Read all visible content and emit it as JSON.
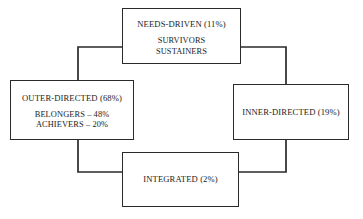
{
  "diagram": {
    "line_color": "#2a2a2a",
    "background_color": "#ffffff",
    "nodes": [
      {
        "id": "needs-driven",
        "title": "NEEDS-DRIVEN (11%)",
        "sub": [
          "SURVIVORS",
          "SUSTAINERS"
        ]
      },
      {
        "id": "outer-directed",
        "title": "OUTER-DIRECTED (68%)",
        "sub": [
          "BELONGERS – 48%",
          "ACHIEVERS – 20%"
        ]
      },
      {
        "id": "inner-directed",
        "title": "INNER-DIRECTED (19%)",
        "sub": []
      },
      {
        "id": "integrated",
        "title": "INTEGRATED (2%)",
        "sub": []
      }
    ],
    "connectors": [
      {
        "id": "needs-to-outer",
        "from": "needs-driven",
        "to": "outer-directed",
        "path": "M 122 47 L 78 47 L 78 80"
      },
      {
        "id": "needs-to-inner",
        "from": "needs-driven",
        "to": "inner-directed",
        "path": "M 241 47 L 286 47 L 286 84"
      },
      {
        "id": "outer-to-integrated",
        "from": "outer-directed",
        "to": "integrated",
        "path": "M 78 140 L 78 172 L 122 172"
      },
      {
        "id": "integrated-to-inner",
        "from": "integrated",
        "to": "inner-directed",
        "path": "M 239 172 L 286 172 L 286 140"
      }
    ]
  }
}
